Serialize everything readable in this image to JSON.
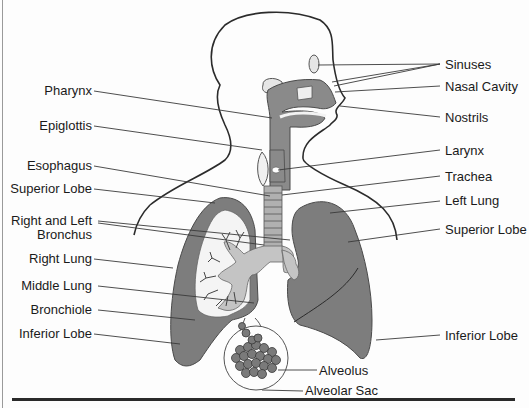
{
  "diagram": {
    "colors": {
      "outline": "#2b2b2b",
      "organ_dark": "#7d7d7d",
      "organ_light": "#c4c4c4",
      "leader_line": "#3a3a3a",
      "background": "#fdfdfd"
    },
    "labels_left": [
      {
        "id": "pharynx",
        "text": "Pharynx"
      },
      {
        "id": "epiglottis",
        "text": "Epiglottis"
      },
      {
        "id": "esophagus",
        "text": "Esophagus"
      },
      {
        "id": "superior-lobe-right",
        "text": "Superior Lobe"
      },
      {
        "id": "bronchus",
        "text": "Right and Left",
        "text2": "Bronchus"
      },
      {
        "id": "right-lung",
        "text": "Right Lung"
      },
      {
        "id": "middle-lung",
        "text": "Middle Lung"
      },
      {
        "id": "bronchiole",
        "text": "Bronchiole"
      },
      {
        "id": "inferior-lobe-right",
        "text": "Inferior Lobe"
      }
    ],
    "labels_right": [
      {
        "id": "sinuses",
        "text": "Sinuses"
      },
      {
        "id": "nasal-cavity",
        "text": "Nasal Cavity"
      },
      {
        "id": "nostrils",
        "text": "Nostrils"
      },
      {
        "id": "larynx",
        "text": "Larynx"
      },
      {
        "id": "trachea",
        "text": "Trachea"
      },
      {
        "id": "left-lung",
        "text": "Left Lung"
      },
      {
        "id": "superior-lobe-left",
        "text": "Superior Lobe"
      },
      {
        "id": "inferior-lobe-left",
        "text": "Inferior Lobe"
      }
    ],
    "labels_bottom": [
      {
        "id": "alveolus",
        "text": "Alveolus"
      },
      {
        "id": "alveolar-sac",
        "text": "Alveolar Sac"
      }
    ]
  }
}
